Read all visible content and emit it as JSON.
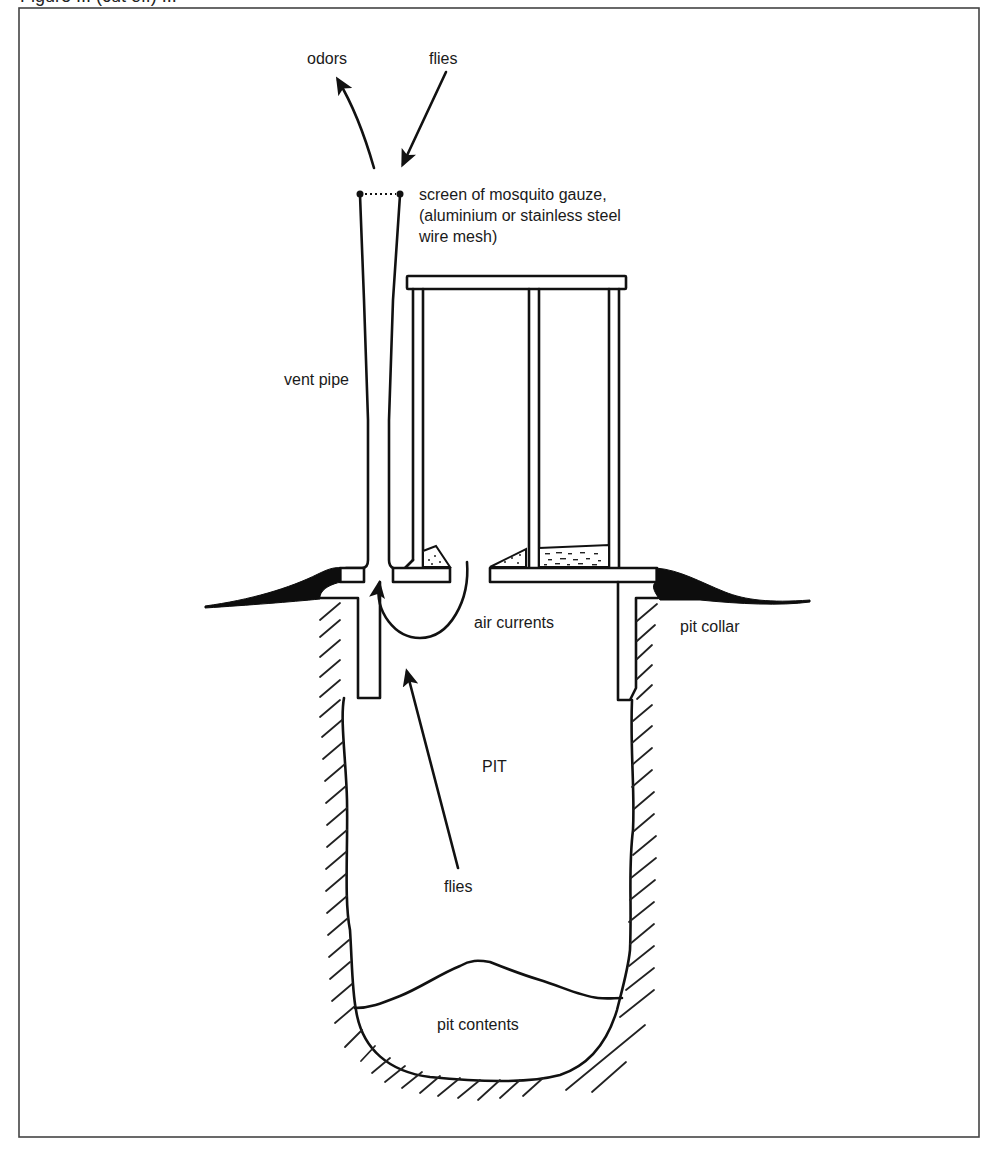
{
  "figure": {
    "caption_partial": "Figure ... (cut off) ...",
    "frame_color": "#333333",
    "ink_color": "#111111",
    "background": "#ffffff"
  },
  "labels": {
    "odors": "odors",
    "flies_top": "flies",
    "screen_line1": "screen of mosquito gauze,",
    "screen_line2": "(aluminium or stainless steel",
    "screen_line3": "wire mesh)",
    "vent_pipe": "vent pipe",
    "air_currents": "air currents",
    "pit_collar": "pit collar",
    "pit": "PIT",
    "flies_bottom": "flies",
    "pit_contents": "pit contents"
  },
  "components": [
    {
      "id": "vent-pipe",
      "name": "vent pipe"
    },
    {
      "id": "fly-screen",
      "name": "screen of mosquito gauze"
    },
    {
      "id": "superstructure",
      "name": "latrine superstructure"
    },
    {
      "id": "cover-slab",
      "name": "cover slab"
    },
    {
      "id": "pit-collar",
      "name": "pit collar"
    },
    {
      "id": "pit",
      "name": "PIT"
    },
    {
      "id": "pit-contents",
      "name": "pit contents"
    }
  ],
  "flows": [
    {
      "id": "odors-out",
      "label": "odors",
      "direction": "up-out of vent"
    },
    {
      "id": "flies-in",
      "label": "flies",
      "direction": "down toward vent screen"
    },
    {
      "id": "air-loop",
      "label": "air currents",
      "direction": "from slab opening into vent"
    },
    {
      "id": "flies-up",
      "label": "flies",
      "direction": "from pit toward light at vent"
    }
  ]
}
